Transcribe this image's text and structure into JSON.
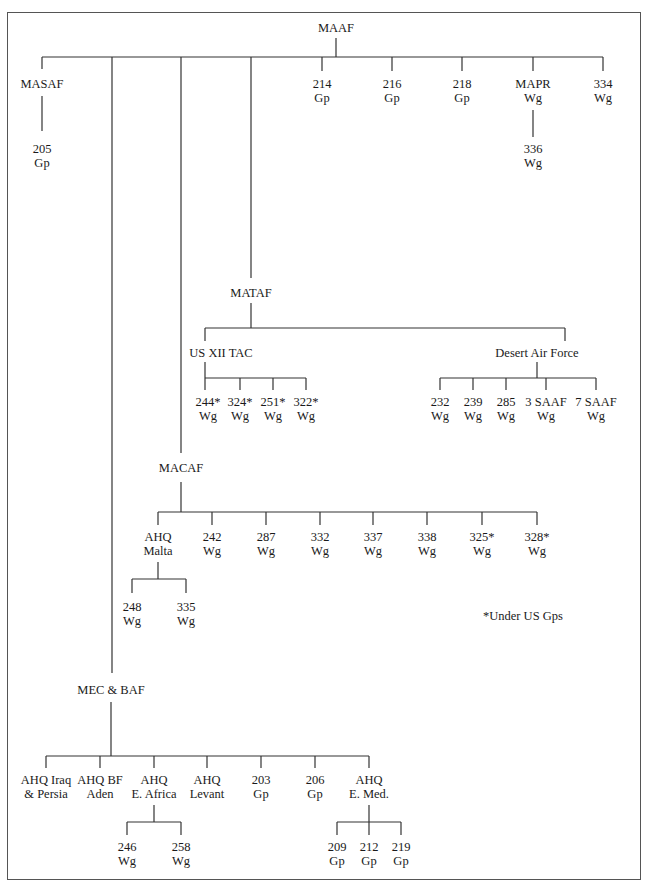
{
  "nodes": {
    "maaf": {
      "l1": "MAAF",
      "l2": ""
    },
    "masaf": {
      "l1": "MASAF",
      "l2": ""
    },
    "g205": {
      "l1": "205",
      "l2": "Gp"
    },
    "g214": {
      "l1": "214",
      "l2": "Gp"
    },
    "g216": {
      "l1": "216",
      "l2": "Gp"
    },
    "g218": {
      "l1": "218",
      "l2": "Gp"
    },
    "mapr": {
      "l1": "MAPR",
      "l2": "Wg"
    },
    "w336": {
      "l1": "336",
      "l2": "Wg"
    },
    "w334": {
      "l1": "334",
      "l2": "Wg"
    },
    "mataf": {
      "l1": "MATAF",
      "l2": ""
    },
    "usxii": {
      "l1": "US XII TAC",
      "l2": ""
    },
    "w244": {
      "l1": "244*",
      "l2": "Wg"
    },
    "w324": {
      "l1": "324*",
      "l2": "Wg"
    },
    "w251": {
      "l1": "251*",
      "l2": "Wg"
    },
    "w322": {
      "l1": "322*",
      "l2": "Wg"
    },
    "daf": {
      "l1": "Desert Air Force",
      "l2": ""
    },
    "w232": {
      "l1": "232",
      "l2": "Wg"
    },
    "w239": {
      "l1": "239",
      "l2": "Wg"
    },
    "w285": {
      "l1": "285",
      "l2": "Wg"
    },
    "saaf3": {
      "l1": "3 SAAF",
      "l2": "Wg"
    },
    "saaf7": {
      "l1": "7 SAAF",
      "l2": "Wg"
    },
    "macaf": {
      "l1": "MACAF",
      "l2": ""
    },
    "ahqmalta": {
      "l1": "AHQ",
      "l2": "Malta"
    },
    "w242": {
      "l1": "242",
      "l2": "Wg"
    },
    "w287": {
      "l1": "287",
      "l2": "Wg"
    },
    "w332": {
      "l1": "332",
      "l2": "Wg"
    },
    "w337": {
      "l1": "337",
      "l2": "Wg"
    },
    "w338": {
      "l1": "338",
      "l2": "Wg"
    },
    "w325": {
      "l1": "325*",
      "l2": "Wg"
    },
    "w328": {
      "l1": "328*",
      "l2": "Wg"
    },
    "w248": {
      "l1": "248",
      "l2": "Wg"
    },
    "w335": {
      "l1": "335",
      "l2": "Wg"
    },
    "mecbaf": {
      "l1": "MEC & BAF",
      "l2": ""
    },
    "ahqiraq": {
      "l1": "AHQ Iraq",
      "l2": "& Persia"
    },
    "ahqbf": {
      "l1": "AHQ BF",
      "l2": "Aden"
    },
    "ahqea": {
      "l1": "AHQ",
      "l2": "E. Africa"
    },
    "ahqlev": {
      "l1": "AHQ",
      "l2": "Levant"
    },
    "g203": {
      "l1": "203",
      "l2": "Gp"
    },
    "g206": {
      "l1": "206",
      "l2": "Gp"
    },
    "ahqem": {
      "l1": "AHQ",
      "l2": "E. Med."
    },
    "w246": {
      "l1": "246",
      "l2": "Wg"
    },
    "w258": {
      "l1": "258",
      "l2": "Wg"
    },
    "g209": {
      "l1": "209",
      "l2": "Gp"
    },
    "g212": {
      "l1": "212",
      "l2": "Gp"
    },
    "g219": {
      "l1": "219",
      "l2": "Gp"
    }
  },
  "footnote": "*Under US Gps",
  "colors": {
    "line": "#333333",
    "text": "#1a1a1a",
    "frame": "#555555"
  }
}
